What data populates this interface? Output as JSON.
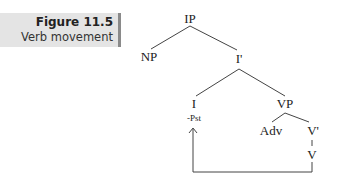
{
  "caption": {
    "title": "Figure 11.5",
    "subtitle": "Verb movement"
  },
  "tree": {
    "nodes": {
      "ip": "IP",
      "np": "NP",
      "ibar": "I'",
      "i": "I",
      "i_feature": "-Pst",
      "vp": "VP",
      "adv": "Adv",
      "vbar": "V'",
      "v": "V"
    },
    "movement": {
      "from": "V",
      "to": "I",
      "type": "arrow"
    }
  },
  "colors": {
    "caption_bg": "#e4e4e4",
    "caption_bar": "#8a8a8a",
    "line": "#444444",
    "text": "#222222"
  }
}
